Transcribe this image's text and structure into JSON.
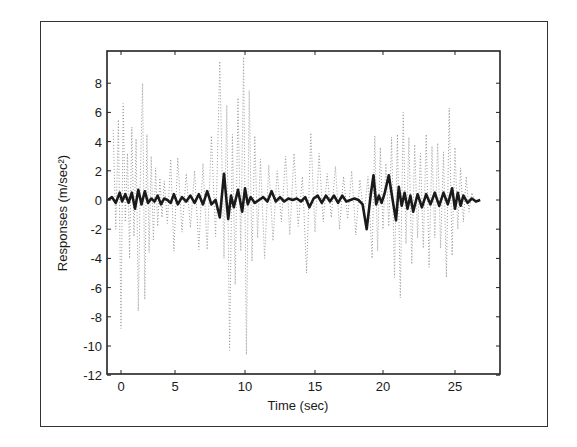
{
  "chart_data": {
    "type": "line",
    "title": "",
    "xlabel": "Time (sec)",
    "ylabel": "Responses (m/sec²)",
    "xlim": [
      -1,
      27.5
    ],
    "ylim": [
      -12,
      10
    ],
    "xticks": [
      0,
      5,
      10,
      15,
      20,
      25
    ],
    "xtick_labels": [
      "0",
      "5",
      "10",
      "15",
      "20",
      "25"
    ],
    "yticks": [
      -12,
      -10,
      -8,
      -6,
      -4,
      -2,
      0,
      2,
      4,
      6,
      8
    ],
    "ytick_labels": [
      "-12",
      "-10",
      "-8",
      "-6",
      "-4",
      "-2",
      "0",
      "2",
      "4",
      "6",
      "8"
    ],
    "grid": false,
    "legend": null,
    "colors": {
      "solid": "#1a1a1a",
      "dotted": "#9a9a9a",
      "axes": "#222222"
    },
    "series": [
      {
        "name": "uncontrolled response (dotted)",
        "style": "dotted",
        "x": [
          -0.6,
          -0.4,
          -0.2,
          0.0,
          0.2,
          0.4,
          0.6,
          0.8,
          1.0,
          1.2,
          1.4,
          1.6,
          1.8,
          2.0,
          2.2,
          2.4,
          2.6,
          2.8,
          3.0,
          3.2,
          3.4,
          3.6,
          3.8,
          4.0,
          4.3,
          4.6,
          4.9,
          5.2,
          5.5,
          5.8,
          6.1,
          6.4,
          6.7,
          7.0,
          7.3,
          7.6,
          7.9,
          8.2,
          8.5,
          8.7,
          8.9,
          9.1,
          9.3,
          9.5,
          9.7,
          9.9,
          10.1,
          10.3,
          10.5,
          10.7,
          10.9,
          11.1,
          11.4,
          11.7,
          12.0,
          12.3,
          12.6,
          12.9,
          13.2,
          13.5,
          13.8,
          14.1,
          14.4,
          14.7,
          15.0,
          15.3,
          15.6,
          15.9,
          16.2,
          16.5,
          16.8,
          17.1,
          17.4,
          17.7,
          18.0,
          18.3,
          18.6,
          18.9,
          19.2,
          19.4,
          19.6,
          19.8,
          20.0,
          20.2,
          20.4,
          20.6,
          20.8,
          21.0,
          21.2,
          21.4,
          21.6,
          21.8,
          22.0,
          22.2,
          22.4,
          22.6,
          22.8,
          23.0,
          23.2,
          23.4,
          23.6,
          23.8,
          24.0,
          24.2,
          24.4,
          24.6,
          24.8,
          25.0,
          25.2,
          25.4,
          25.6,
          25.8,
          26.0,
          26.2,
          26.5
        ],
        "y": [
          4.8,
          -2.0,
          5.5,
          -8.8,
          6.6,
          -1.5,
          3.2,
          -4.0,
          5.0,
          -2.5,
          4.2,
          -7.6,
          1.8,
          8.0,
          -6.8,
          4.5,
          -3.6,
          3.0,
          -2.8,
          2.2,
          -1.8,
          1.5,
          -1.2,
          1.3,
          -1.6,
          2.8,
          -3.5,
          2.9,
          -2.2,
          1.8,
          -1.9,
          2.0,
          -3.4,
          2.5,
          -3.4,
          4.4,
          -2.5,
          9.5,
          -4.0,
          6.5,
          -10.3,
          4.5,
          -5.8,
          7.0,
          -3.5,
          9.8,
          -10.6,
          7.5,
          -4.2,
          4.4,
          -2.6,
          2.8,
          -4.0,
          2.4,
          -2.8,
          2.0,
          -1.5,
          3.0,
          -2.4,
          3.2,
          -1.8,
          1.6,
          -5.0,
          4.6,
          -2.2,
          3.2,
          -1.5,
          1.8,
          -1.2,
          2.3,
          -2.0,
          1.6,
          -1.3,
          2.0,
          -2.4,
          1.4,
          -1.1,
          1.6,
          -4.0,
          4.4,
          -3.5,
          3.6,
          -2.0,
          2.5,
          -1.8,
          4.3,
          -5.3,
          4.5,
          -6.7,
          6.0,
          -3.0,
          4.3,
          -4.4,
          3.8,
          -2.6,
          3.2,
          -3.3,
          4.5,
          -4.6,
          3.7,
          -2.6,
          3.9,
          -3.3,
          3.3,
          -5.3,
          6.3,
          -3.8,
          3.6,
          -2.0,
          2.2,
          -1.5,
          1.6,
          -0.8,
          0.5,
          -0.3
        ]
      },
      {
        "name": "controlled response (solid)",
        "style": "solid",
        "x": [
          -1.0,
          -0.7,
          -0.4,
          -0.1,
          0.1,
          0.4,
          0.7,
          1.0,
          1.3,
          1.6,
          1.9,
          2.2,
          2.5,
          2.8,
          3.1,
          3.4,
          3.7,
          4.0,
          4.3,
          4.6,
          4.9,
          5.2,
          5.5,
          5.8,
          6.1,
          6.4,
          6.7,
          7.0,
          7.3,
          7.6,
          7.9,
          8.2,
          8.5,
          8.8,
          9.0,
          9.2,
          9.5,
          9.8,
          10.0,
          10.2,
          10.4,
          10.7,
          11.0,
          11.3,
          11.6,
          11.9,
          12.2,
          12.5,
          12.8,
          13.1,
          13.4,
          13.7,
          14.0,
          14.3,
          14.6,
          14.9,
          15.2,
          15.5,
          15.8,
          16.1,
          16.4,
          16.7,
          17.0,
          17.3,
          17.6,
          17.9,
          18.2,
          18.5,
          18.8,
          19.1,
          19.3,
          19.5,
          19.7,
          19.9,
          20.1,
          20.4,
          20.7,
          20.9,
          21.1,
          21.3,
          21.5,
          21.7,
          21.9,
          22.1,
          22.4,
          22.7,
          23.0,
          23.3,
          23.6,
          23.9,
          24.2,
          24.5,
          24.8,
          25.0,
          25.2,
          25.4,
          25.6,
          25.9,
          26.2,
          26.5,
          26.8
        ],
        "y": [
          0.0,
          0.2,
          -0.2,
          0.5,
          -0.1,
          0.4,
          -0.2,
          0.5,
          -0.6,
          0.7,
          -0.3,
          0.6,
          -0.2,
          0.1,
          -0.1,
          0.3,
          -0.3,
          0.1,
          0.0,
          -0.2,
          0.4,
          -0.3,
          0.2,
          -0.1,
          0.3,
          -0.2,
          0.4,
          -0.3,
          0.6,
          -0.3,
          0.0,
          -1.2,
          1.8,
          -1.3,
          0.3,
          -0.5,
          0.7,
          -0.8,
          0.8,
          -0.3,
          0.2,
          -0.2,
          0.0,
          0.2,
          -0.1,
          0.6,
          -0.1,
          0.2,
          -0.1,
          0.1,
          0.0,
          0.1,
          -0.1,
          0.2,
          -0.5,
          0.1,
          0.3,
          -0.2,
          0.3,
          -0.1,
          0.3,
          -0.2,
          0.3,
          -0.1,
          0.0,
          0.1,
          0.0,
          -0.3,
          -2.0,
          0.4,
          1.7,
          -0.3,
          0.3,
          -0.2,
          0.4,
          1.7,
          -0.2,
          -1.4,
          0.9,
          -0.4,
          0.5,
          -0.6,
          0.3,
          -0.8,
          0.4,
          -0.5,
          0.4,
          -0.3,
          0.5,
          -0.4,
          0.5,
          -0.3,
          0.8,
          -0.6,
          0.5,
          -0.4,
          0.3,
          -0.2,
          0.1,
          -0.1,
          0.0
        ]
      }
    ]
  },
  "axes": {
    "xlabel": "Time (sec)",
    "ylabel": "Responses (m/sec²)"
  }
}
